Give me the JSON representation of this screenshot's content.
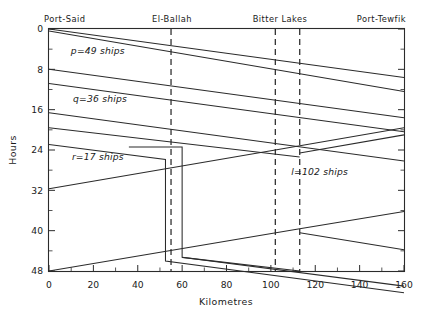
{
  "figure": {
    "kind": "time-distance convoy diagram",
    "background": "#ffffff",
    "ink": "#2b2b2b"
  },
  "chart_data": {
    "type": "line",
    "title": "",
    "subtitle": "",
    "xlabel": "Kilometres",
    "ylabel": "Hours",
    "xlim": [
      0,
      160
    ],
    "ylim": [
      48,
      0
    ],
    "y_inverted": true,
    "grid": false,
    "legend_position": "none",
    "xticks": [
      0,
      20,
      40,
      60,
      80,
      100,
      120,
      140,
      160
    ],
    "xtick_labels": [
      "0",
      "20",
      "40",
      "60",
      "80",
      "100",
      "120",
      "140",
      "160"
    ],
    "xminor_step": 10,
    "yticks": [
      0,
      8,
      16,
      24,
      32,
      40,
      48
    ],
    "ytick_labels": [
      "0",
      "8",
      "16",
      "24",
      "32",
      "40",
      "48"
    ],
    "yminor_step": 4,
    "stations": [
      {
        "name": "Port-Said",
        "km": 0,
        "dashed": false,
        "label_align": "left"
      },
      {
        "name": "El-Ballah",
        "km": 55,
        "dashed": true,
        "label_align": "center"
      },
      {
        "name": "Bitter Lakes",
        "km": 102,
        "dashed": true,
        "label_align": "center"
      },
      {
        "name": "Bitter Lakes South",
        "km": 113,
        "dashed": true,
        "label_align": "none"
      },
      {
        "name": "Port-Tewfik",
        "km": 160,
        "dashed": false,
        "label_align": "right"
      }
    ],
    "annotations": [
      {
        "text": "p=49 ships",
        "km": 22,
        "hour": 5.0
      },
      {
        "text": "q=36 ships",
        "km": 23,
        "hour": 14.5
      },
      {
        "text": "r=17 ships",
        "km": 22,
        "hour": 26.0
      },
      {
        "text": "l=102 ships",
        "km": 122,
        "hour": 29.0
      }
    ],
    "series": [
      {
        "name": "southbound-convoy-1a",
        "direction": "south",
        "points": [
          [
            0,
            0
          ],
          [
            160,
            9.6
          ]
        ]
      },
      {
        "name": "southbound-convoy-1b",
        "direction": "south",
        "points": [
          [
            0,
            0.4
          ],
          [
            160,
            12.4
          ]
        ]
      },
      {
        "name": "southbound-convoy-2a",
        "direction": "south",
        "points": [
          [
            0,
            8.0
          ],
          [
            160,
            17.6
          ]
        ]
      },
      {
        "name": "southbound-convoy-2b",
        "direction": "south",
        "points": [
          [
            0,
            10.8
          ],
          [
            160,
            20.4
          ]
        ]
      },
      {
        "name": "southbound-convoy-3a",
        "direction": "south",
        "points": [
          [
            0,
            16.6
          ],
          [
            160,
            26.2
          ]
        ]
      },
      {
        "name": "southbound-convoy-3b",
        "direction": "south",
        "points": [
          [
            0,
            19.6
          ],
          [
            113,
            25.4
          ]
        ]
      },
      {
        "name": "southbound-convoy-4-ballah-wait",
        "direction": "south",
        "points": [
          [
            0,
            22.9
          ],
          [
            52.5,
            25.9
          ],
          [
            52.5,
            46.0
          ],
          [
            160,
            52.3
          ]
        ]
      },
      {
        "name": "southbound-convoy-4b-ballah-wait",
        "direction": "south",
        "points": [
          [
            36,
            23.4
          ],
          [
            60,
            23.4
          ],
          [
            60,
            45.3
          ],
          [
            160,
            51.0
          ]
        ]
      },
      {
        "name": "northbound-convoy-1",
        "direction": "north",
        "points": [
          [
            0,
            31.7
          ],
          [
            102,
            24.0
          ],
          [
            160,
            19.6
          ]
        ]
      },
      {
        "name": "northbound-convoy-2",
        "direction": "north",
        "points": [
          [
            0,
            48.0
          ],
          [
            113,
            39.6
          ],
          [
            160,
            36.2
          ]
        ]
      },
      {
        "name": "northbound-convoy-3-tail",
        "direction": "north",
        "points": [
          [
            113,
            40.4
          ],
          [
            160,
            43.8
          ]
        ]
      },
      {
        "name": "southbound-tail-lower",
        "direction": "south",
        "points": [
          [
            60,
            45.3
          ],
          [
            113,
            48.0
          ]
        ]
      },
      {
        "name": "northbound-segment-upper-right",
        "direction": "north",
        "points": [
          [
            113,
            24.6
          ],
          [
            160,
            21.0
          ]
        ]
      }
    ]
  }
}
